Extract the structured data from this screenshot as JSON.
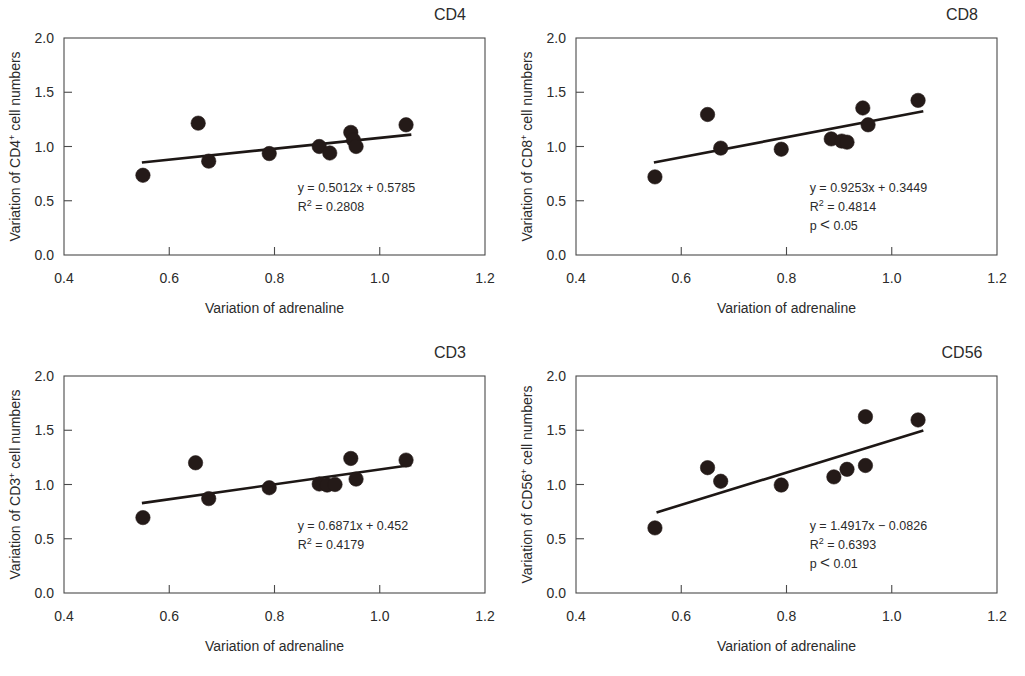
{
  "figure": {
    "panel_count": 4,
    "marker_color": "#241a18",
    "line_color": "#1d1715",
    "axis_color": "#4a4a4a",
    "text_color": "#2b2b2b"
  },
  "chart_data": [
    {
      "type": "scatter",
      "title": "CD4",
      "xlabel": "Variation of adrenaline",
      "ylabel_prefix": "Variation of CD4",
      "ylabel_sup": "+",
      "ylabel_suffix": " cell numbers",
      "xlim": [
        0.4,
        1.2
      ],
      "ylim": [
        0.0,
        2.0
      ],
      "xticks": [
        0.4,
        0.6,
        0.8,
        1.0,
        1.2
      ],
      "xticklabels": [
        "0.4",
        "0.6",
        "0.8",
        "1.0",
        "1.2"
      ],
      "yticks": [
        0.0,
        0.5,
        1.0,
        1.5,
        2.0
      ],
      "yticklabels": [
        "0.0",
        "0.5",
        "1.0",
        "1.5",
        "2.0"
      ],
      "grid": false,
      "x": [
        0.55,
        0.655,
        0.675,
        0.79,
        0.885,
        0.905,
        0.945,
        0.95,
        0.955,
        1.05
      ],
      "y": [
        0.735,
        1.215,
        0.865,
        0.935,
        1.0,
        0.94,
        1.13,
        1.06,
        1.0,
        1.2
      ],
      "fit": {
        "slope": 0.5012,
        "intercept": 0.5785,
        "x_start": 0.548,
        "x_end": 1.06
      },
      "annotations": {
        "equation": "y = 0.5012x + 0.5785",
        "r2_symbol": "R",
        "r2_sup": "2",
        "r2_value": " = 0.2808",
        "pvalue": null
      }
    },
    {
      "type": "scatter",
      "title": "CD8",
      "xlabel": "Variation of adrenaline",
      "ylabel_prefix": "Variation of CD8",
      "ylabel_sup": "+",
      "ylabel_suffix": " cell numbers",
      "xlim": [
        0.4,
        1.2
      ],
      "ylim": [
        0.0,
        2.0
      ],
      "xticks": [
        0.4,
        0.6,
        0.8,
        1.0,
        1.2
      ],
      "xticklabels": [
        "0.4",
        "0.6",
        "0.8",
        "1.0",
        "1.2"
      ],
      "yticks": [
        0.0,
        0.5,
        1.0,
        1.5,
        2.0
      ],
      "yticklabels": [
        "0.0",
        "0.5",
        "1.0",
        "1.5",
        "2.0"
      ],
      "grid": false,
      "x": [
        0.55,
        0.65,
        0.675,
        0.79,
        0.885,
        0.905,
        0.915,
        0.945,
        0.955,
        1.05
      ],
      "y": [
        0.72,
        1.295,
        0.985,
        0.975,
        1.07,
        1.05,
        1.04,
        1.355,
        1.2,
        1.425
      ],
      "fit": {
        "slope": 0.9253,
        "intercept": 0.3449,
        "x_start": 0.548,
        "x_end": 1.06
      },
      "annotations": {
        "equation": "y = 0.9253x + 0.3449",
        "r2_symbol": "R",
        "r2_sup": "2",
        "r2_value": " = 0.4814",
        "pvalue": "p < 0.05"
      }
    },
    {
      "type": "scatter",
      "title": "CD3",
      "xlabel": "Variation of adrenaline",
      "ylabel_prefix": "Variation of CD3",
      "ylabel_sup": "+",
      "ylabel_suffix": " cell numbers",
      "xlim": [
        0.4,
        1.2
      ],
      "ylim": [
        0.0,
        2.0
      ],
      "xticks": [
        0.4,
        0.6,
        0.8,
        1.0,
        1.2
      ],
      "xticklabels": [
        "0.4",
        "0.6",
        "0.8",
        "1.0",
        "1.2"
      ],
      "yticks": [
        0.0,
        0.5,
        1.0,
        1.5,
        2.0
      ],
      "yticklabels": [
        "0.0",
        "0.5",
        "1.0",
        "1.5",
        "2.0"
      ],
      "grid": false,
      "x": [
        0.55,
        0.65,
        0.675,
        0.79,
        0.885,
        0.9,
        0.915,
        0.945,
        0.955,
        1.05
      ],
      "y": [
        0.695,
        1.2,
        0.87,
        0.97,
        1.005,
        0.995,
        1.0,
        1.24,
        1.05,
        1.225
      ],
      "fit": {
        "slope": 0.6871,
        "intercept": 0.452,
        "x_start": 0.548,
        "x_end": 1.06
      },
      "annotations": {
        "equation": "y = 0.6871x + 0.452",
        "r2_symbol": "R",
        "r2_sup": "2",
        "r2_value": " = 0.4179",
        "pvalue": null
      }
    },
    {
      "type": "scatter",
      "title": "CD56",
      "xlabel": "Variation of adrenaline",
      "ylabel_prefix": "Variation of CD56",
      "ylabel_sup": "+",
      "ylabel_suffix": " cell numbers",
      "xlim": [
        0.4,
        1.2
      ],
      "ylim": [
        0.0,
        2.0
      ],
      "xticks": [
        0.4,
        0.6,
        0.8,
        1.0,
        1.2
      ],
      "xticklabels": [
        "0.4",
        "0.6",
        "0.8",
        "1.0",
        "1.2"
      ],
      "yticks": [
        0.0,
        0.5,
        1.0,
        1.5,
        2.0
      ],
      "yticklabels": [
        "0.0",
        "0.5",
        "1.0",
        "1.5",
        "2.0"
      ],
      "grid": false,
      "x": [
        0.55,
        0.65,
        0.675,
        0.79,
        0.89,
        0.915,
        0.95,
        0.95,
        1.05
      ],
      "y": [
        0.6,
        1.155,
        1.03,
        0.995,
        1.07,
        1.14,
        1.175,
        1.625,
        1.595
      ],
      "fit": {
        "slope": 1.4917,
        "intercept": -0.0826,
        "x_start": 0.553,
        "x_end": 1.06
      },
      "annotations": {
        "equation": "y = 1.4917x − 0.0826",
        "r2_symbol": "R",
        "r2_sup": "2",
        "r2_value": " = 0.6393",
        "pvalue": "p < 0.01"
      }
    }
  ]
}
